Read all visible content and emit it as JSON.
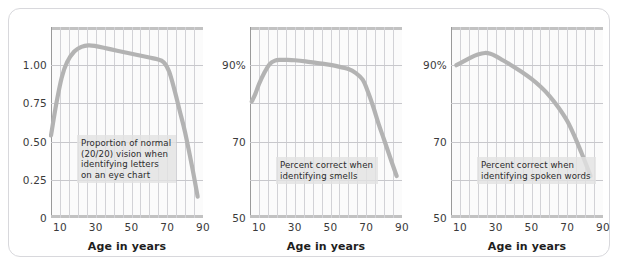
{
  "figure": {
    "panel_count": 3,
    "curve_color": "#b3b3b3",
    "grid_color": "#d2d2d6",
    "annotation_bg": "#e2e2e2",
    "frame_color": "#d8d8dc"
  },
  "chart_data": [
    {
      "type": "line",
      "title": "",
      "xlabel": "Age in years",
      "ylabel": "",
      "annotation": "Proportion of normal\n(20/20) vision when\nidentifying letters\non an eye chart",
      "xlim": [
        5,
        90
      ],
      "ylim": [
        0,
        1.25
      ],
      "xticks": [
        10,
        30,
        50,
        70,
        90
      ],
      "xticklabels": [
        "10",
        "30",
        "50",
        "70",
        "90"
      ],
      "yticks": [
        0,
        0.25,
        0.5,
        0.75,
        1.0
      ],
      "yticklabels": [
        "0",
        "0.25",
        "0.50",
        "0.75",
        "1.00"
      ],
      "grid": true,
      "x": [
        5,
        8,
        11,
        14,
        18,
        22,
        26,
        30,
        36,
        42,
        48,
        54,
        60,
        64,
        68,
        71,
        74,
        77,
        80,
        84,
        87
      ],
      "y": [
        0.54,
        0.75,
        0.92,
        1.02,
        1.09,
        1.12,
        1.13,
        1.125,
        1.11,
        1.095,
        1.08,
        1.065,
        1.05,
        1.04,
        1.02,
        0.96,
        0.84,
        0.7,
        0.56,
        0.33,
        0.14
      ]
    },
    {
      "type": "line",
      "title": "",
      "xlabel": "Age in years",
      "ylabel": "",
      "annotation": "Percent correct when\nidentifying smells",
      "xlim": [
        5,
        90
      ],
      "ylim": [
        50,
        100
      ],
      "xticks": [
        10,
        30,
        50,
        70,
        90
      ],
      "xticklabels": [
        "10",
        "30",
        "50",
        "70",
        "90"
      ],
      "yticks": [
        50,
        70,
        90
      ],
      "yticklabels": [
        "50",
        "70",
        "90%"
      ],
      "grid": true,
      "x": [
        6,
        8,
        10,
        13,
        16,
        19,
        22,
        26,
        30,
        36,
        42,
        48,
        54,
        60,
        64,
        68,
        71,
        74,
        77,
        80,
        84,
        87
      ],
      "y": [
        80.5,
        82.5,
        85.0,
        88.0,
        90.3,
        91.2,
        91.4,
        91.4,
        91.3,
        91.0,
        90.6,
        90.2,
        89.7,
        89.0,
        88.0,
        86.2,
        83.0,
        79.0,
        74.5,
        70.5,
        65.0,
        61.0
      ]
    },
    {
      "type": "line",
      "title": "",
      "xlabel": "Age in years",
      "ylabel": "",
      "annotation": "Percent correct when\nidentifying spoken words",
      "xlim": [
        5,
        90
      ],
      "ylim": [
        50,
        100
      ],
      "xticks": [
        10,
        30,
        50,
        70,
        90
      ],
      "xticklabels": [
        "10",
        "30",
        "50",
        "70",
        "90"
      ],
      "yticks": [
        50,
        70,
        90
      ],
      "yticklabels": [
        "50",
        "70",
        "90%"
      ],
      "grid": true,
      "x": [
        8,
        12,
        16,
        20,
        24,
        27,
        30,
        34,
        38,
        44,
        50,
        55,
        60,
        65,
        70,
        74,
        78,
        81,
        83
      ],
      "y": [
        90.0,
        91.0,
        92.0,
        92.8,
        93.2,
        93.0,
        92.4,
        91.3,
        90.2,
        88.4,
        86.4,
        84.4,
        82.0,
        79.0,
        75.4,
        71.5,
        67.0,
        63.5,
        61.0
      ]
    }
  ]
}
